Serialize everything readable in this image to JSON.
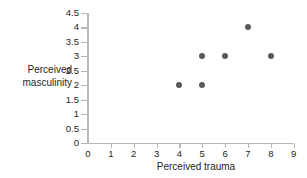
{
  "chart_data": {
    "type": "scatter",
    "title": "",
    "xlabel": "Perceived trauma",
    "ylabel_line1": "Perceived",
    "ylabel_line2": "masculinity",
    "ylabel": "Perceived masculinity",
    "x": [
      4,
      5,
      5,
      6,
      7,
      8
    ],
    "y": [
      2,
      2,
      3,
      3,
      4,
      3
    ],
    "points": [
      {
        "x": 4,
        "y": 2
      },
      {
        "x": 5,
        "y": 2
      },
      {
        "x": 5,
        "y": 3
      },
      {
        "x": 6,
        "y": 3
      },
      {
        "x": 7,
        "y": 4
      },
      {
        "x": 8,
        "y": 3
      }
    ],
    "xlim": [
      0,
      9
    ],
    "ylim": [
      0,
      4.5
    ],
    "xticks": [
      0,
      1,
      2,
      3,
      4,
      5,
      6,
      7,
      8,
      9
    ],
    "xtick_labels": [
      "0",
      "1",
      "2",
      "3",
      "4",
      "5",
      "6",
      "7",
      "8",
      "9"
    ],
    "yticks": [
      0,
      0.5,
      1,
      1.5,
      2,
      2.5,
      3,
      3.5,
      4,
      4.5
    ],
    "ytick_labels": [
      "0",
      "0.5",
      "1",
      "1.5",
      "2",
      "2.5",
      "3",
      "3.5",
      "4",
      "4.5"
    ],
    "grid": false,
    "legend": null,
    "marker_color": "#58595b",
    "axis_color": "#b6b8ba",
    "background_color": "#ffffff"
  }
}
